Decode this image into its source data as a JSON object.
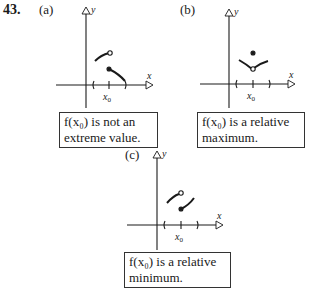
{
  "problem_number": "43.",
  "panels": [
    {
      "label": "(a)",
      "axis_x": "x",
      "axis_y": "y",
      "tick_label": "x0",
      "caption_line1": "f(x₀) is not an",
      "caption_line2": "extreme value."
    },
    {
      "label": "(b)",
      "axis_x": "x",
      "axis_y": "y",
      "tick_label": "x0",
      "caption_line1": "f(x₀) is a relative",
      "caption_line2": "maximum."
    },
    {
      "label": "(c)",
      "axis_x": "x",
      "axis_y": "y",
      "tick_label": "x0",
      "caption_line1": "f(x₀) is a relative",
      "caption_line2": "minimum."
    }
  ],
  "colors": {
    "ink": "#1a1a1a",
    "background": "#ffffff"
  }
}
